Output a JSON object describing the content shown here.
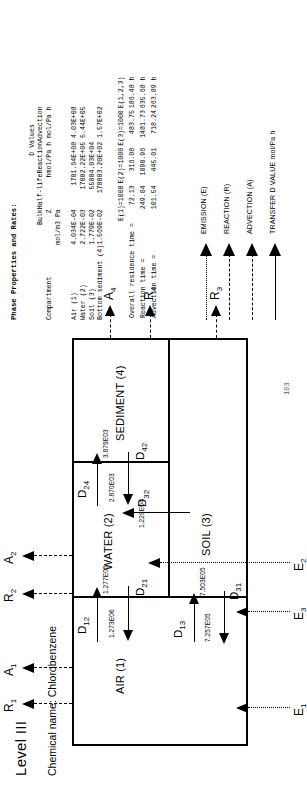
{
  "title": "Level III",
  "chemical_label": "Chemical name: Chlorobenzene",
  "page_number": "103",
  "diagram": {
    "compartments": [
      {
        "key": "air",
        "label": "AIR (1)"
      },
      {
        "key": "water",
        "label": "WATER (2)"
      },
      {
        "key": "soil",
        "label": "SOIL (3)"
      },
      {
        "key": "sediment",
        "label": "SEDIMENT (4)"
      }
    ],
    "transfer_arrows": [
      {
        "name": "D12",
        "label": "D",
        "sub": "12",
        "value": ""
      },
      {
        "name": "D21",
        "label": "D",
        "sub": "21",
        "value": "1.273E06"
      },
      {
        "name": "D13",
        "label": "D",
        "sub": "13",
        "value": ""
      },
      {
        "name": "D31",
        "label": "D",
        "sub": "31",
        "value": "7.257E05"
      },
      {
        "name": "D24",
        "label": "D",
        "sub": "24",
        "value": "3.879E03"
      },
      {
        "name": "D42",
        "label": "D",
        "sub": "42",
        "value": "2.870E03"
      },
      {
        "name": "D32",
        "label": "D",
        "sub": "32",
        "value": "1.228E04"
      },
      {
        "name": "D13v",
        "label": "",
        "sub": "",
        "value": "7.503E05"
      },
      {
        "name": "D12v",
        "label": "",
        "sub": "",
        "value": "1.277E05"
      }
    ],
    "emissions": [
      {
        "name": "E1",
        "label": "E",
        "sub": "1"
      },
      {
        "name": "E2",
        "label": "E",
        "sub": "2"
      },
      {
        "name": "E3",
        "label": "E",
        "sub": "3"
      }
    ],
    "reactions": [
      {
        "name": "R1",
        "label": "R",
        "sub": "1"
      },
      {
        "name": "R2",
        "label": "R",
        "sub": "2"
      },
      {
        "name": "R3",
        "label": "R",
        "sub": "3"
      },
      {
        "name": "R4",
        "label": "R",
        "sub": "4"
      }
    ],
    "advections": [
      {
        "name": "A1",
        "label": "A",
        "sub": "1"
      },
      {
        "name": "A2",
        "label": "A",
        "sub": "2"
      },
      {
        "name": "A4",
        "label": "A",
        "sub": "4"
      }
    ]
  },
  "panel": {
    "heading": "Phase Properties and Rates:",
    "headers": {
      "compartment": "Compartment",
      "bulk_l1": "Bulk",
      "bulk_l2": "Z",
      "bulk_l3": "mol/m3 Pa",
      "halflife_l1": "Half-life",
      "halflife_l2": "h",
      "dvalues_group": "D Values",
      "reaction_l1": "Reaction",
      "reaction_l2": "mol/Pa h",
      "advection_l1": "Advection",
      "advection_l2": "mol/Pa h"
    },
    "rows": [
      {
        "compartment": "Air (1)",
        "bulk_z": "4.034E-04",
        "half_life": "170",
        "d_reaction": "1.64E+08",
        "d_advection": "4.03E+08"
      },
      {
        "compartment": "Water (2)",
        "bulk_z": "2.722E-03",
        "half_life": "1700",
        "d_reaction": "2.22E+05",
        "d_advection": "5.44E+05"
      },
      {
        "compartment": "Soil (3)",
        "bulk_z": "1.779E-02",
        "half_life": "5500",
        "d_reaction": "4.03E+04",
        "d_advection": ""
      },
      {
        "compartment": "Bottom sediment (4)",
        "bulk_z": "1.569E-02",
        "half_life": "17000",
        "d_reaction": "3.20E+02",
        "d_advection": "1.57E+02"
      }
    ],
    "residence": {
      "col_headers": [
        "E(1)=1000",
        "E(2)=1000",
        "E(3)=1000",
        "E(1,2,3)"
      ],
      "rows": [
        {
          "label": "Overall residence time =",
          "e1": "72.13",
          "e2": "316.08",
          "e3": "483.75",
          "e123": "186.48 h"
        },
        {
          "label": "Reaction time =",
          "e1": "249.04",
          "e2": "1090.96",
          "e3": "1481.73",
          "e123": "635.68 h"
        },
        {
          "label": "Advection time =",
          "e1": "101.54",
          "e2": "445.01",
          "e3": "718.24",
          "e123": "263.89 h"
        }
      ]
    }
  },
  "legend": [
    {
      "name": "emission",
      "label": "EMISSION (E)",
      "style": "dotted"
    },
    {
      "name": "reaction",
      "label": "REACTION (R)",
      "style": "dashed"
    },
    {
      "name": "advection",
      "label": "ADVECTION (A)",
      "style": "dashdot"
    },
    {
      "name": "transfer-d",
      "label": "TRANSFER D VALUE mol/Pa h",
      "style": "solid"
    }
  ]
}
